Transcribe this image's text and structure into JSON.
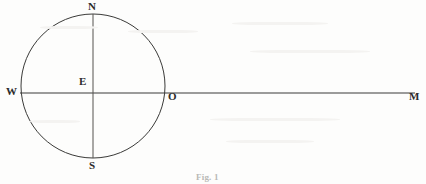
{
  "figure": {
    "caption": "Fig. 1",
    "background_color": "#fdfdfc",
    "ink_color": "#2b2b2b",
    "width": 426,
    "height": 184
  },
  "labels": {
    "north": "N",
    "south": "S",
    "west": "W",
    "center": "E",
    "circle_right": "O",
    "ray_end": "M"
  },
  "geometry": {
    "circle": {
      "cx": 93,
      "cy": 86,
      "r": 72
    },
    "horizontal_line": {
      "x1": 20,
      "y1": 93,
      "x2": 415,
      "y2": 93
    },
    "vertical_line": {
      "x1": 93,
      "y1": 14,
      "x2": 93,
      "y2": 158
    }
  }
}
